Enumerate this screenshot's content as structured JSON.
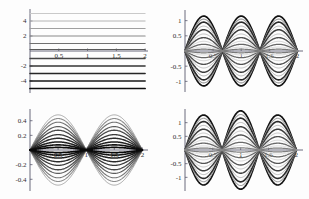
{
  "figure": {
    "background_color": "#fdfdfd",
    "axis_color": "#5a5a6e",
    "layout": "2x2 grid of line plots",
    "panels": [
      {
        "name": "top-left",
        "x_ticks": [
          "0.5",
          "1",
          "1.5",
          "2"
        ],
        "y_ticks": [
          "4",
          "2",
          "-2",
          "-4"
        ]
      },
      {
        "name": "top-right",
        "x_ticks": [
          "0.5",
          "1",
          "1.5",
          "2"
        ],
        "y_ticks": [
          "1",
          "0.5",
          "-0.5",
          "-1"
        ]
      },
      {
        "name": "bottom-left",
        "x_ticks": [
          "0.5",
          "1",
          "1.5",
          "2"
        ],
        "y_ticks": [
          "0.4",
          "0.2",
          "-0.2",
          "-0.4"
        ]
      },
      {
        "name": "bottom-right",
        "x_ticks": [
          "0.5",
          "1",
          "1.5",
          "2"
        ],
        "y_ticks": [
          "1",
          "0.5",
          "-0.5",
          "-1"
        ]
      }
    ]
  },
  "chart_data": [
    {
      "type": "line",
      "title": "",
      "xlabel": "",
      "ylabel": "",
      "panel": "top-left",
      "xlim": [
        0,
        2.05
      ],
      "ylim": [
        -5.6,
        5.6
      ],
      "x_ticks": [
        0.5,
        1,
        1.5,
        2
      ],
      "x_tick_labels": [
        "0.5",
        "1",
        "1.5",
        "2"
      ],
      "y_ticks": [
        4,
        2,
        -2,
        -4
      ],
      "y_tick_labels": [
        "4",
        "2",
        "-2",
        "-4"
      ],
      "grid": false,
      "legend": "none",
      "description": "Eleven horizontal straight lines at evenly spaced constant y values, grayscale shading from light at top to dark at bottom.",
      "x": [
        0,
        2
      ],
      "series": [
        {
          "name": "c = 5",
          "values": [
            5,
            5
          ],
          "gray": "#c9c9c9",
          "width": 1.0
        },
        {
          "name": "c = 4",
          "values": [
            4,
            4
          ],
          "gray": "#b4b4b4",
          "width": 1.0
        },
        {
          "name": "c = 3",
          "values": [
            3,
            3
          ],
          "gray": "#a0a0a0",
          "width": 1.1
        },
        {
          "name": "c = 2",
          "values": [
            2,
            2
          ],
          "gray": "#8a8a8a",
          "width": 1.1
        },
        {
          "name": "c = 1",
          "values": [
            1,
            1
          ],
          "gray": "#707070",
          "width": 1.2
        },
        {
          "name": "c = 0",
          "values": [
            0.2,
            0.2
          ],
          "gray": "#5a5a5a",
          "width": 1.2
        },
        {
          "name": "c = -1",
          "values": [
            -1,
            -1
          ],
          "gray": "#464646",
          "width": 1.3
        },
        {
          "name": "c = -2",
          "values": [
            -2,
            -2
          ],
          "gray": "#343434",
          "width": 1.4
        },
        {
          "name": "c = -3",
          "values": [
            -3,
            -3
          ],
          "gray": "#262626",
          "width": 1.5
        },
        {
          "name": "c = -4",
          "values": [
            -4,
            -4
          ],
          "gray": "#171717",
          "width": 1.6
        },
        {
          "name": "c = -5",
          "values": [
            -5,
            -5
          ],
          "gray": "#0d0d0d",
          "width": 1.7
        }
      ]
    },
    {
      "type": "line",
      "title": "",
      "xlabel": "",
      "ylabel": "",
      "panel": "top-right",
      "xlim": [
        0,
        2.1
      ],
      "ylim": [
        -1.35,
        1.35
      ],
      "x_ticks": [
        0.5,
        1,
        1.5,
        2
      ],
      "x_tick_labels": [
        "0.5",
        "1",
        "1.5",
        "2"
      ],
      "y_ticks": [
        1,
        0.5,
        -0.5,
        -1
      ],
      "y_tick_labels": [
        "1",
        "0.5",
        "-0.5",
        "-1"
      ],
      "grid": false,
      "legend": "none",
      "description": "Family of three-lobed standing-wave curves (nodes at x = 0, 0.667, 1.333, 2) with amplitudes from about 0.05 to 1.15; alternating light and dark grayscale.",
      "nodes": [
        0,
        0.667,
        1.333,
        2
      ],
      "lobes": 3,
      "amplitudes": [
        1.15,
        1.05,
        0.95,
        0.82,
        0.7,
        0.56,
        0.44,
        0.32,
        0.22,
        0.13,
        0.06
      ],
      "grays": [
        "#111111",
        "#9a9a9a",
        "#2a2a2a",
        "#b0b0b0",
        "#3c3c3c",
        "#c0c0c0",
        "#505050",
        "#cccccc",
        "#666666",
        "#d4d4d4",
        "#7a7a7a"
      ],
      "widths": [
        1.7,
        1.1,
        1.6,
        1.0,
        1.5,
        1.0,
        1.4,
        0.9,
        1.3,
        0.9,
        1.2
      ]
    },
    {
      "type": "line",
      "title": "",
      "xlabel": "",
      "ylabel": "",
      "panel": "bottom-left",
      "xlim": [
        0,
        2.1
      ],
      "ylim": [
        -0.56,
        0.56
      ],
      "x_ticks": [
        0.5,
        1,
        1.5,
        2
      ],
      "x_tick_labels": [
        "0.5",
        "1",
        "1.5",
        "2"
      ],
      "y_ticks": [
        0.4,
        0.2,
        -0.2,
        -0.4
      ],
      "y_tick_labels": [
        "0.4",
        "0.2",
        "-0.2",
        "-0.4"
      ],
      "grid": false,
      "legend": "none",
      "description": "Family of two-lobed standing-wave curves (nodes at x = 0, 1, 2) with amplitudes from about 0.03 to 0.48; grayscale from light to dark.",
      "nodes": [
        0,
        1,
        2
      ],
      "lobes": 2,
      "amplitudes": [
        0.48,
        0.43,
        0.38,
        0.32,
        0.27,
        0.21,
        0.16,
        0.11,
        0.07,
        0.035
      ],
      "grays": [
        "#a8a8a8",
        "#8e8e8e",
        "#757575",
        "#5d5d5d",
        "#4a4a4a",
        "#3a3a3a",
        "#2c2c2c",
        "#1f1f1f",
        "#141414",
        "#0a0a0a"
      ],
      "widths": [
        1.0,
        1.1,
        1.1,
        1.2,
        1.3,
        1.3,
        1.4,
        1.5,
        1.6,
        1.7
      ],
      "mirrored": true
    },
    {
      "type": "line",
      "title": "",
      "xlabel": "",
      "ylabel": "",
      "panel": "bottom-right",
      "xlim": [
        0,
        2.12
      ],
      "ylim": [
        -1.5,
        1.5
      ],
      "x_ticks": [
        0.5,
        1,
        1.5,
        2
      ],
      "x_tick_labels": [
        "0.5",
        "1",
        "1.5",
        "2"
      ],
      "y_ticks": [
        1,
        0.5,
        -0.5,
        -1
      ],
      "y_tick_labels": [
        "1",
        "0.5",
        "-0.5",
        "-1"
      ],
      "grid": false,
      "legend": "none",
      "description": "Family of three-lobed standing-wave curves (nodes at x = 0, 0.667, 1.333, 2) with the centre lobe reaching larger amplitude; alternating light and dark grayscale.",
      "nodes": [
        0,
        0.667,
        1.333,
        2
      ],
      "lobes": 3,
      "amplitudes": [
        1.28,
        1.16,
        1.04,
        0.9,
        0.76,
        0.62,
        0.49,
        0.36,
        0.25,
        0.15,
        0.07
      ],
      "grays": [
        "#131313",
        "#a4a4a4",
        "#2b2b2b",
        "#b8b8b8",
        "#3e3e3e",
        "#c6c6c6",
        "#545454",
        "#d0d0d0",
        "#6a6a6a",
        "#d8d8d8",
        "#808080"
      ],
      "widths": [
        1.7,
        1.1,
        1.6,
        1.0,
        1.5,
        1.0,
        1.4,
        0.9,
        1.3,
        0.9,
        1.2
      ],
      "center_emphasis": true
    }
  ]
}
